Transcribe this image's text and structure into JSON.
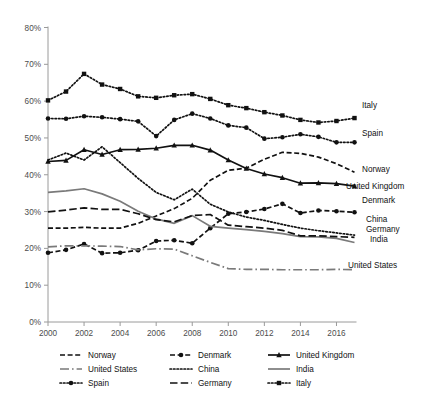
{
  "chart_data": {
    "type": "line",
    "title": "",
    "xlabel": "",
    "ylabel": "",
    "xlim": [
      2000,
      2017
    ],
    "ylim": [
      0,
      80
    ],
    "ytick_format": "percent",
    "grid": false,
    "legend_position": "bottom",
    "x": [
      2000,
      2001,
      2002,
      2003,
      2004,
      2005,
      2006,
      2007,
      2008,
      2009,
      2010,
      2011,
      2012,
      2013,
      2014,
      2015,
      2016,
      2017
    ],
    "xticks": [
      "2000",
      "2002",
      "2004",
      "2006",
      "2008",
      "2010",
      "2012",
      "2014",
      "2016"
    ],
    "yticks": [
      "0%",
      "10%",
      "20%",
      "30%",
      "40%",
      "50%",
      "60%",
      "70%",
      "80%"
    ],
    "series": [
      {
        "name": "Norway",
        "style": "dashed",
        "marker": "none",
        "color": "#111111",
        "end_label": "Norway",
        "values": [
          25.5,
          25.5,
          25.7,
          25.5,
          25.5,
          26.8,
          28.8,
          30.8,
          33.6,
          38.5,
          41.2,
          41.8,
          44.2,
          46.1,
          45.8,
          44.8,
          43.0,
          40.7
        ]
      },
      {
        "name": "Denmark",
        "style": "dashed",
        "marker": "circle",
        "color": "#111111",
        "end_label": "Denmark",
        "values": [
          18.8,
          19.6,
          21.2,
          18.7,
          18.8,
          19.5,
          22.0,
          22.2,
          21.4,
          25.5,
          29.4,
          29.9,
          30.7,
          32.1,
          29.6,
          30.3,
          30.1,
          29.8
        ]
      },
      {
        "name": "United Kingdom",
        "style": "solid",
        "marker": "triangle",
        "color": "#111111",
        "end_label": "United Kingdom",
        "values": [
          43.6,
          43.9,
          46.8,
          45.5,
          46.8,
          46.9,
          47.2,
          48.0,
          48.0,
          46.7,
          44.0,
          41.7,
          40.2,
          39.2,
          37.7,
          37.8,
          37.6,
          36.9
        ]
      },
      {
        "name": "United States",
        "style": "dashdot-gray",
        "marker": "none",
        "color": "#7a7a7a",
        "end_label": "United States",
        "values": [
          20.4,
          20.7,
          20.7,
          20.6,
          20.5,
          19.6,
          19.9,
          19.8,
          18.0,
          16.2,
          14.5,
          14.3,
          14.3,
          14.2,
          14.2,
          14.2,
          14.3,
          14.2
        ]
      },
      {
        "name": "China",
        "style": "dotted",
        "marker": "none",
        "color": "#111111",
        "end_label": "China",
        "values": [
          44.0,
          45.9,
          44.0,
          47.6,
          43.3,
          39.0,
          35.2,
          33.2,
          36.1,
          32.0,
          29.9,
          28.5,
          27.6,
          26.5,
          25.5,
          24.8,
          24.2,
          23.6
        ]
      },
      {
        "name": "India",
        "style": "solid-gray",
        "marker": "none",
        "color": "#7a7a7a",
        "end_label": "India",
        "values": [
          35.2,
          35.6,
          36.2,
          34.8,
          32.8,
          30.1,
          28.0,
          26.8,
          28.9,
          26.0,
          25.5,
          25.1,
          24.6,
          24.0,
          23.2,
          23.1,
          22.7,
          21.6
        ]
      },
      {
        "name": "Spain",
        "style": "dotted",
        "marker": "circle",
        "color": "#111111",
        "end_label": "Spain",
        "values": [
          55.3,
          55.2,
          55.9,
          55.6,
          55.1,
          54.5,
          50.5,
          54.9,
          56.6,
          55.3,
          53.4,
          52.8,
          49.8,
          50.2,
          51.0,
          50.3,
          48.8,
          48.8
        ]
      },
      {
        "name": "Germany",
        "style": "dashed-long",
        "marker": "none",
        "color": "#111111",
        "end_label": "Germany",
        "values": [
          29.9,
          30.4,
          31.0,
          30.6,
          30.6,
          29.4,
          27.8,
          27.2,
          28.9,
          29.2,
          26.3,
          25.9,
          25.5,
          24.9,
          23.4,
          23.4,
          23.2,
          23.0
        ]
      },
      {
        "name": "Italy",
        "style": "dotted",
        "marker": "square",
        "color": "#111111",
        "end_label": "Italy",
        "values": [
          60.2,
          62.6,
          67.4,
          64.5,
          63.3,
          61.3,
          60.9,
          61.6,
          61.9,
          60.6,
          58.9,
          58.1,
          57.0,
          56.1,
          54.9,
          54.2,
          54.6,
          55.4
        ]
      }
    ]
  },
  "legend": {
    "rows": [
      [
        {
          "label": "Norway",
          "style": "dashed",
          "marker": "none"
        },
        {
          "label": "Denmark",
          "style": "dashed",
          "marker": "circle"
        },
        {
          "label": "United Kingdom",
          "style": "solid",
          "marker": "triangle"
        }
      ],
      [
        {
          "label": "United States",
          "style": "dashdot-gray",
          "marker": "none"
        },
        {
          "label": "China",
          "style": "dotted",
          "marker": "none"
        },
        {
          "label": "India",
          "style": "solid-gray",
          "marker": "none"
        }
      ],
      [
        {
          "label": "Spain",
          "style": "dotted",
          "marker": "circle"
        },
        {
          "label": "Germany",
          "style": "dashed-long",
          "marker": "none"
        },
        {
          "label": "Italy",
          "style": "dotted",
          "marker": "square"
        }
      ]
    ]
  },
  "axes": {
    "y_labels": [
      "80%",
      "70%",
      "60%",
      "50%",
      "40%",
      "30%",
      "20%",
      "10%",
      "0%"
    ],
    "x_labels": [
      "2000",
      "2002",
      "2004",
      "2006",
      "2008",
      "2010",
      "2012",
      "2014",
      "2016"
    ]
  },
  "end_labels": [
    {
      "name": "Italy",
      "text": "Italy"
    },
    {
      "name": "Spain",
      "text": "Spain"
    },
    {
      "name": "Norway",
      "text": "Norway"
    },
    {
      "name": "United Kingdom",
      "text": "United Kingdom"
    },
    {
      "name": "Denmark",
      "text": "Denmark"
    },
    {
      "name": "China",
      "text": "China"
    },
    {
      "name": "Germany",
      "text": "Germany"
    },
    {
      "name": "India",
      "text": "India"
    },
    {
      "name": "United States",
      "text": "United States"
    }
  ]
}
